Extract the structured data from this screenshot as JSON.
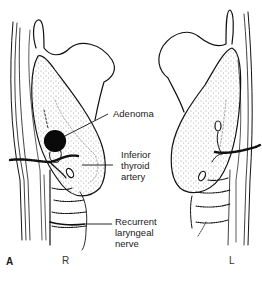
{
  "figure": {
    "panel_letter": "A",
    "labels": {
      "adenoma": "Adenoma",
      "inferior_thyroid_artery": "Inferior\nthyroid\nartery",
      "recurrent_laryngeal_nerve": "Recurrent\nlaryngeal\nnerve"
    },
    "sides": {
      "right": "R",
      "left": "L"
    }
  }
}
